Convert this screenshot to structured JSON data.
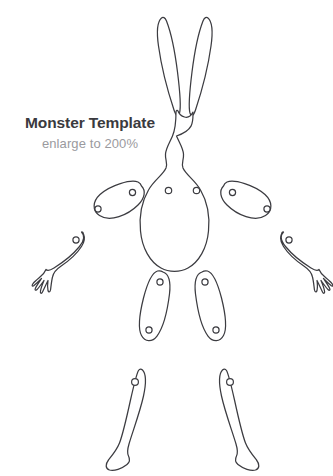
{
  "sheet": {
    "title": "Monster Template",
    "subtitle": "enlarge to 200%",
    "background_color": "#ffffff",
    "outline_color": "#3c3c41",
    "title_color": "#3a3a3e",
    "subtitle_color": "#9a9a9e"
  },
  "pieces": {
    "head": {
      "label": "head-with-ears",
      "joint_hole_count": 0
    },
    "body": {
      "label": "body-torso",
      "joint_hole_count": 2
    },
    "left_upper_arm": {
      "label": "left-upper-arm",
      "joint_hole_count": 2
    },
    "right_upper_arm": {
      "label": "right-upper-arm",
      "joint_hole_count": 2
    },
    "left_forearm": {
      "label": "left-forearm-with-hand",
      "joint_hole_count": 1
    },
    "right_forearm": {
      "label": "right-forearm-with-hand",
      "joint_hole_count": 1
    },
    "left_thigh": {
      "label": "left-thigh",
      "joint_hole_count": 2
    },
    "right_thigh": {
      "label": "right-thigh",
      "joint_hole_count": 2
    },
    "left_lower_leg": {
      "label": "left-lower-leg-with-foot",
      "joint_hole_count": 1
    },
    "right_lower_leg": {
      "label": "right-lower-leg-with-foot",
      "joint_hole_count": 1
    }
  }
}
